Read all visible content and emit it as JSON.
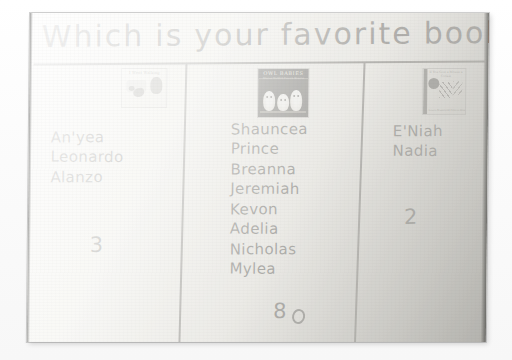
{
  "poster": {
    "title_words": [
      "Which",
      "is",
      "your",
      "favorite",
      "book",
      "?"
    ],
    "title_text": "Which is your favorite book?"
  },
  "chart_data": {
    "type": "bar",
    "xlabel": "Book",
    "ylabel": "Number of votes",
    "categories": [
      "I Went Walking",
      "Owl Babies",
      "Mouse / picture book"
    ],
    "values": [
      3,
      8,
      2
    ],
    "ylim": [
      0,
      8
    ],
    "grid": false,
    "legend": "none",
    "note": "Tally chart: each column lists the names of students who voted, with the count written at the bottom."
  },
  "columns": [
    {
      "id": "column-1",
      "cover": {
        "name": "i-went-walking-cover",
        "title": "I Went Walking",
        "credit": ""
      },
      "names": [
        "An'yea",
        "Leonardo",
        "Alanzo"
      ],
      "total": "3"
    },
    {
      "id": "column-2",
      "cover": {
        "name": "owl-babies-cover",
        "title": "OWL BABIES",
        "credit": "Martin Waddell  Patrick Benson"
      },
      "names": [
        "Shauncea",
        "Prince",
        "Breanna",
        "Jeremiah",
        "Kevon",
        "Adelia",
        "Nicholas",
        "Mylea"
      ],
      "total": "8"
    },
    {
      "id": "column-3",
      "cover": {
        "name": "picture-book-cover",
        "title": "If You Give a Mouse a Cookie",
        "credit": "Laura Numeroff  Felicia Bond"
      },
      "names": [
        "E'Niah",
        "Nadia"
      ],
      "total": "2"
    }
  ],
  "colors": {
    "paper": "#f3f2ee",
    "ink": "#262523",
    "rule": "#44423f",
    "shadow": "#57554f"
  }
}
